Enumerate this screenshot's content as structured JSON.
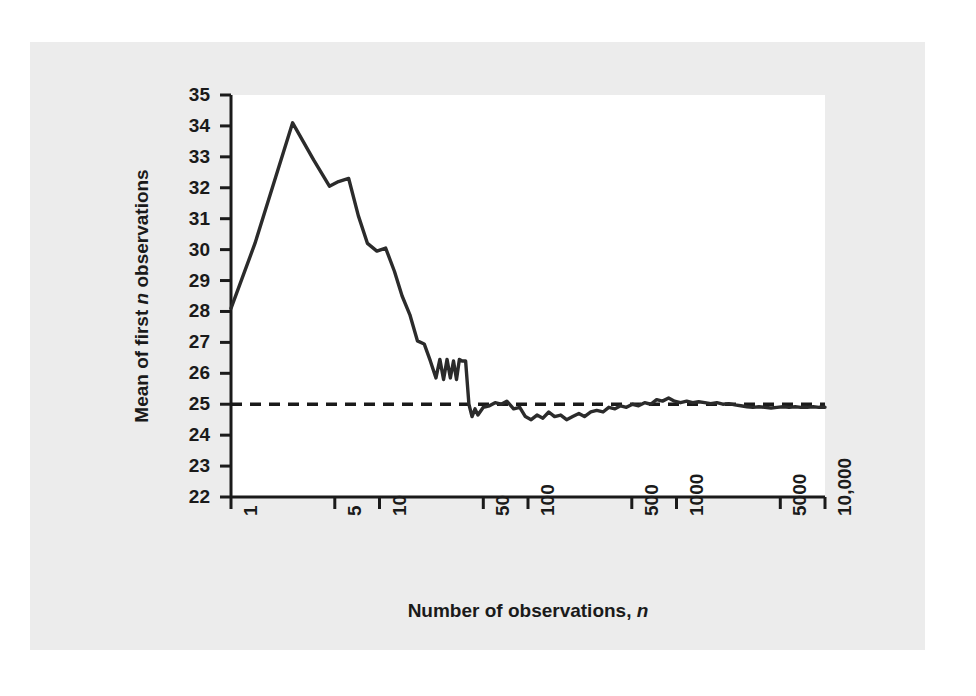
{
  "chart_data": {
    "type": "line",
    "title": "",
    "xlabel": "Number of observations, n",
    "ylabel": "Mean of first n observations",
    "xscale": "log",
    "xlim": [
      1,
      10000
    ],
    "ylim": [
      22,
      35
    ],
    "grid": false,
    "legend": "none",
    "xticks": [
      1,
      5,
      10,
      50,
      100,
      500,
      1000,
      5000,
      10000
    ],
    "xtick_labels": [
      "1",
      "5",
      "10",
      "50",
      "100",
      "500",
      "1000",
      "5000",
      "10,000"
    ],
    "yticks": [
      22,
      23,
      24,
      25,
      26,
      27,
      28,
      29,
      30,
      31,
      32,
      33,
      34,
      35
    ],
    "ytick_labels": [
      "22",
      "23",
      "24",
      "25",
      "26",
      "27",
      "28",
      "29",
      "30",
      "31",
      "32",
      "33",
      "34",
      "35"
    ],
    "reference_line": {
      "name": "population-mean",
      "value": 25,
      "style": "dashed",
      "color": "#1a1a1a"
    },
    "series": [
      {
        "name": "running-mean",
        "color": "#2b2b2b",
        "x": [
          1,
          1.45,
          2.6,
          3.6,
          4.6,
          5.3,
          6.2,
          7.2,
          8.3,
          9.6,
          11.0,
          12.6,
          14.2,
          16.0,
          18.0,
          20.0,
          22.0,
          24.0,
          25.5,
          27.0,
          28.5,
          30.0,
          31.5,
          33.0,
          34.5,
          36.0,
          38.0,
          40.0,
          42.0,
          44.0,
          46.0,
          50.0,
          55.0,
          60.0,
          66.0,
          72.0,
          80.0,
          88.0,
          96.0,
          105.0,
          115.0,
          126.0,
          138.0,
          151.0,
          166.0,
          182.0,
          200.0,
          220.0,
          240.0,
          265.0,
          290.0,
          320.0,
          350.0,
          385.0,
          420.0,
          460.0,
          505.0,
          555.0,
          610.0,
          670.0,
          735.0,
          805.0,
          885.0,
          970.0,
          1065.0,
          1170.0,
          1285.0,
          1410.0,
          1550.0,
          1700.0,
          1870.0,
          2050.0,
          2250.0,
          2470.0,
          2710.0,
          2980.0,
          3270.0,
          3590.0,
          3940.0,
          4330.0,
          4750.0,
          5220.0,
          5730.0,
          6290.0,
          6900.0,
          7580.0,
          8320.0,
          9130.0,
          10000.0
        ],
        "y": [
          28.1,
          30.2,
          34.1,
          32.9,
          32.05,
          32.2,
          32.3,
          31.1,
          30.2,
          29.95,
          30.05,
          29.3,
          28.5,
          27.9,
          27.05,
          26.95,
          26.4,
          25.85,
          26.45,
          25.8,
          26.45,
          25.85,
          26.4,
          25.8,
          26.45,
          26.4,
          26.4,
          25.0,
          24.6,
          24.85,
          24.65,
          24.9,
          24.95,
          25.05,
          25.0,
          25.1,
          24.85,
          24.9,
          24.6,
          24.5,
          24.65,
          24.55,
          24.75,
          24.6,
          24.65,
          24.5,
          24.6,
          24.7,
          24.6,
          24.75,
          24.8,
          24.75,
          24.9,
          24.85,
          24.95,
          24.9,
          25.0,
          24.95,
          25.05,
          25.0,
          25.15,
          25.1,
          25.2,
          25.1,
          25.05,
          25.1,
          25.05,
          25.08,
          25.05,
          25.02,
          25.05,
          25.0,
          25.02,
          24.98,
          24.95,
          24.92,
          24.9,
          24.92,
          24.9,
          24.88,
          24.9,
          24.92,
          24.9,
          24.92,
          24.9,
          24.9,
          24.92,
          24.9,
          24.9
        ]
      }
    ]
  },
  "axes": {
    "x_title_prefix": "Number of observations, ",
    "x_title_italic": "n",
    "y_title_part1": "Mean of first ",
    "y_title_italic": "n",
    "y_title_part2": " observations"
  }
}
